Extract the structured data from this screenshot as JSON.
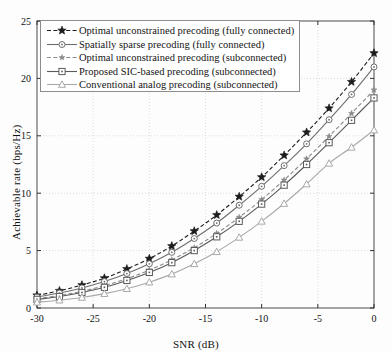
{
  "chart_data": {
    "type": "line",
    "title": "",
    "xlabel": "SNR (dB)",
    "ylabel": "Achievable rate (bps/Hz)",
    "xlim": [
      -30,
      0
    ],
    "ylim": [
      0,
      25
    ],
    "xticks": [
      -30,
      -25,
      -20,
      -15,
      -10,
      -5,
      0
    ],
    "yticks": [
      0,
      5,
      10,
      15,
      20,
      25
    ],
    "xtick_labels": [
      "-30",
      "-25",
      "-20",
      "-15",
      "-10",
      "-5",
      "0"
    ],
    "ytick_labels": [
      "0",
      "5",
      "10",
      "15",
      "20",
      "25"
    ],
    "grid": true,
    "legend_position": "upper left",
    "x": [
      -30,
      -28,
      -26,
      -24,
      -22,
      -20,
      -18,
      -16,
      -14,
      -12,
      -10,
      -8,
      -6,
      -4,
      -2,
      0
    ],
    "series": [
      {
        "name": "Optimal unconstrained precoding (fully connected)",
        "marker": "star-filled",
        "linestyle": "dashed",
        "color": "#1c1c1c",
        "values": [
          1.1,
          1.5,
          2.0,
          2.6,
          3.4,
          4.3,
          5.4,
          6.7,
          8.1,
          9.7,
          11.4,
          13.3,
          15.3,
          17.4,
          19.7,
          22.2
        ]
      },
      {
        "name": "Spatially sparse precoding (fully connected)",
        "marker": "circle",
        "linestyle": "solid",
        "color": "#6e6e6e",
        "values": [
          0.95,
          1.3,
          1.75,
          2.3,
          3.0,
          3.85,
          4.85,
          6.05,
          7.4,
          8.95,
          10.6,
          12.4,
          14.3,
          16.4,
          18.6,
          21.0
        ]
      },
      {
        "name": "Optimal unconstrained precoding (subconnected)",
        "marker": "star-small",
        "linestyle": "dashed",
        "color": "#8a8a8a",
        "values": [
          0.8,
          1.1,
          1.45,
          1.95,
          2.55,
          3.3,
          4.2,
          5.25,
          6.5,
          7.9,
          9.45,
          11.15,
          13.0,
          14.95,
          16.95,
          19.0
        ]
      },
      {
        "name": "Proposed SIC-based precoding (subconnected)",
        "marker": "square",
        "linestyle": "solid",
        "color": "#5a5a5a",
        "values": [
          0.75,
          1.0,
          1.35,
          1.8,
          2.4,
          3.1,
          3.95,
          5.0,
          6.2,
          7.55,
          9.05,
          10.7,
          12.5,
          14.4,
          16.35,
          18.3
        ]
      },
      {
        "name": "Conventional analog precoding (subconnected)",
        "marker": "triangle",
        "linestyle": "solid",
        "color": "#a9a9a9",
        "values": [
          0.5,
          0.68,
          0.92,
          1.25,
          1.68,
          2.25,
          2.95,
          3.85,
          4.9,
          6.15,
          7.55,
          9.1,
          10.8,
          12.6,
          14.0,
          15.5
        ]
      }
    ]
  },
  "legend": {
    "items": [
      "Optimal unconstrained precoding (fully connected)",
      "Spatially sparse precoding (fully connected)",
      "Optimal unconstrained precoding (subconnected)",
      "Proposed SIC-based precoding (subconnected)",
      "Conventional analog precoding (subconnected)"
    ]
  },
  "axes": {
    "xlabel": "SNR (dB)",
    "ylabel": "Achievable rate (bps/Hz)"
  }
}
